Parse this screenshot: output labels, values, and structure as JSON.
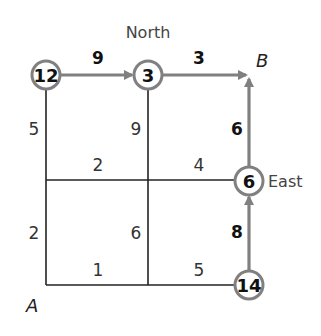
{
  "diagram": {
    "directions": {
      "north": "North",
      "east": "East"
    },
    "corners": {
      "start": "A",
      "end": "B"
    },
    "colors": {
      "grid_line": "#222222",
      "path": "#808080",
      "node_border": "#808080",
      "text": "#111111"
    },
    "nodes": [
      {
        "id": "n12",
        "value": "12",
        "position": "top-left"
      },
      {
        "id": "n3",
        "value": "3",
        "position": "top-middle"
      },
      {
        "id": "n6",
        "value": "6",
        "position": "middle-right"
      },
      {
        "id": "n14",
        "value": "14",
        "position": "bottom-right"
      }
    ],
    "edges": {
      "top_left": "9",
      "top_right": "3",
      "left_upper": "5",
      "left_lower": "2",
      "middle_upper": "9",
      "middle_lower": "6",
      "mid_row_left": "2",
      "mid_row_right": "4",
      "right_upper": "6",
      "right_lower": "8",
      "bottom_left": "1",
      "bottom_right": "5"
    }
  }
}
